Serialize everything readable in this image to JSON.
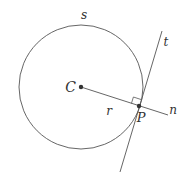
{
  "diagram": {
    "colors": {
      "stroke": "#555555",
      "label": "#333333",
      "point": "#333333",
      "background": "#ffffff"
    },
    "circle": {
      "label": "s",
      "cx": 81,
      "cy": 87,
      "r": 62
    },
    "points": {
      "center": {
        "label": "C",
        "x": 81,
        "y": 87
      },
      "tangent_point": {
        "label": "P",
        "x": 139,
        "y": 106
      }
    },
    "segments": {
      "radius": {
        "label": "r"
      },
      "tangent_line": {
        "label": "t"
      },
      "normal_line": {
        "label": "n"
      }
    },
    "right_angle_marker": true
  }
}
